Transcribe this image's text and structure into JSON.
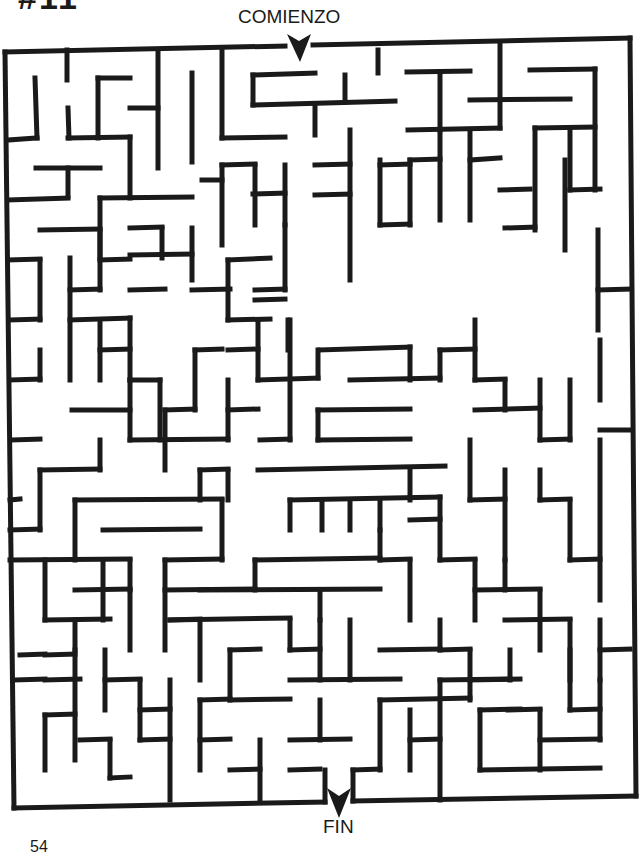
{
  "page": {
    "puzzle_number": "#11",
    "start_label": "COMIENZO",
    "end_label": "FIN",
    "page_number": "54"
  },
  "maze": {
    "wall_color": "#1a1a1a",
    "wall_width": 5,
    "border": [
      [
        5,
        50
      ],
      [
        300,
        44
      ],
      [
        300,
        44
      ],
      [
        300,
        44
      ]
    ],
    "outline": [
      [
        5,
        52,
        285,
        46
      ],
      [
        313,
        45,
        630,
        38
      ],
      [
        630,
        38,
        636,
        796
      ],
      [
        5,
        52,
        14,
        808
      ],
      [
        14,
        808,
        325,
        802
      ],
      [
        353,
        801,
        636,
        796
      ]
    ],
    "walls": [
      [
        35,
        78,
        37,
        138
      ],
      [
        8,
        140,
        37,
        138
      ],
      [
        67,
        50,
        67,
        80
      ],
      [
        68,
        108,
        69,
        138
      ],
      [
        68,
        138,
        130,
        137
      ],
      [
        98,
        78,
        130,
        78
      ],
      [
        98,
        78,
        98,
        138
      ],
      [
        130,
        108,
        158,
        108
      ],
      [
        158,
        50,
        158,
        168
      ],
      [
        192,
        73,
        192,
        162
      ],
      [
        130,
        137,
        130,
        198
      ],
      [
        36,
        168,
        100,
        168
      ],
      [
        68,
        168,
        68,
        196
      ],
      [
        8,
        200,
        68,
        198
      ],
      [
        100,
        198,
        192,
        197
      ],
      [
        100,
        198,
        100,
        258
      ],
      [
        222,
        50,
        222,
        138
      ],
      [
        222,
        138,
        285,
        137
      ],
      [
        253,
        75,
        315,
        73
      ],
      [
        253,
        75,
        253,
        105
      ],
      [
        253,
        105,
        395,
        101
      ],
      [
        315,
        105,
        315,
        135
      ],
      [
        345,
        75,
        345,
        102
      ],
      [
        378,
        50,
        378,
        73
      ],
      [
        407,
        72,
        470,
        71
      ],
      [
        440,
        72,
        440,
        130
      ],
      [
        408,
        130,
        500,
        128
      ],
      [
        470,
        100,
        570,
        99
      ],
      [
        500,
        44,
        500,
        128
      ],
      [
        530,
        70,
        595,
        69
      ],
      [
        595,
        69,
        595,
        190
      ],
      [
        535,
        128,
        595,
        127
      ],
      [
        535,
        128,
        535,
        230
      ],
      [
        202,
        180,
        222,
        180
      ],
      [
        222,
        165,
        222,
        245
      ],
      [
        222,
        165,
        255,
        164
      ],
      [
        255,
        165,
        255,
        225
      ],
      [
        285,
        165,
        285,
        225
      ],
      [
        253,
        194,
        285,
        193
      ],
      [
        315,
        165,
        350,
        164
      ],
      [
        350,
        130,
        350,
        280
      ],
      [
        315,
        195,
        350,
        194
      ],
      [
        380,
        165,
        410,
        164
      ],
      [
        380,
        160,
        380,
        225
      ],
      [
        380,
        225,
        410,
        224
      ],
      [
        410,
        160,
        410,
        225
      ],
      [
        410,
        160,
        440,
        159
      ],
      [
        440,
        130,
        440,
        220
      ],
      [
        470,
        130,
        470,
        220
      ],
      [
        470,
        160,
        500,
        158
      ],
      [
        500,
        190,
        530,
        189
      ],
      [
        570,
        130,
        570,
        190
      ],
      [
        570,
        190,
        600,
        189
      ],
      [
        505,
        228,
        535,
        227
      ],
      [
        565,
        160,
        565,
        250
      ],
      [
        598,
        230,
        598,
        330
      ],
      [
        598,
        290,
        630,
        289
      ],
      [
        40,
        230,
        100,
        229
      ],
      [
        100,
        230,
        100,
        290
      ],
      [
        100,
        260,
        130,
        259
      ],
      [
        130,
        228,
        162,
        227
      ],
      [
        162,
        228,
        162,
        258
      ],
      [
        192,
        228,
        192,
        280
      ],
      [
        130,
        255,
        192,
        254
      ],
      [
        8,
        260,
        40,
        259
      ],
      [
        40,
        260,
        40,
        320
      ],
      [
        70,
        258,
        70,
        380
      ],
      [
        70,
        290,
        100,
        289
      ],
      [
        130,
        290,
        165,
        289
      ],
      [
        10,
        320,
        40,
        319
      ],
      [
        40,
        350,
        40,
        380
      ],
      [
        10,
        380,
        40,
        379
      ],
      [
        70,
        320,
        130,
        318
      ],
      [
        100,
        320,
        100,
        380
      ],
      [
        100,
        350,
        130,
        349
      ],
      [
        130,
        318,
        130,
        380
      ],
      [
        130,
        380,
        160,
        380
      ],
      [
        72,
        410,
        130,
        410
      ],
      [
        130,
        380,
        130,
        440
      ],
      [
        160,
        380,
        160,
        440
      ],
      [
        192,
        290,
        230,
        289
      ],
      [
        228,
        260,
        228,
        320
      ],
      [
        228,
        260,
        270,
        258
      ],
      [
        228,
        320,
        270,
        319
      ],
      [
        255,
        300,
        285,
        299
      ],
      [
        285,
        225,
        285,
        290
      ],
      [
        255,
        290,
        285,
        289
      ],
      [
        258,
        320,
        258,
        380
      ],
      [
        258,
        380,
        318,
        378
      ],
      [
        318,
        378,
        318,
        350
      ],
      [
        288,
        320,
        288,
        350
      ],
      [
        228,
        350,
        258,
        349
      ],
      [
        195,
        350,
        222,
        349
      ],
      [
        195,
        350,
        195,
        410
      ],
      [
        165,
        410,
        195,
        409
      ],
      [
        165,
        410,
        165,
        470
      ],
      [
        228,
        410,
        258,
        409
      ],
      [
        228,
        380,
        228,
        440
      ],
      [
        130,
        440,
        228,
        439
      ],
      [
        100,
        440,
        100,
        470
      ],
      [
        40,
        470,
        100,
        469
      ],
      [
        40,
        470,
        40,
        530
      ],
      [
        12,
        440,
        40,
        439
      ],
      [
        10,
        530,
        40,
        529
      ],
      [
        10,
        500,
        20,
        499
      ],
      [
        228,
        470,
        228,
        500
      ],
      [
        200,
        470,
        228,
        469
      ],
      [
        290,
        320,
        290,
        440
      ],
      [
        260,
        440,
        290,
        439
      ],
      [
        320,
        350,
        410,
        347
      ],
      [
        410,
        347,
        410,
        380
      ],
      [
        350,
        380,
        440,
        378
      ],
      [
        440,
        350,
        440,
        380
      ],
      [
        440,
        350,
        475,
        349
      ],
      [
        475,
        320,
        475,
        380
      ],
      [
        475,
        380,
        505,
        379
      ],
      [
        505,
        380,
        505,
        410
      ],
      [
        475,
        410,
        540,
        408
      ],
      [
        540,
        380,
        540,
        440
      ],
      [
        540,
        440,
        570,
        439
      ],
      [
        570,
        380,
        570,
        440
      ],
      [
        600,
        340,
        600,
        400
      ],
      [
        600,
        430,
        630,
        430
      ],
      [
        318,
        410,
        410,
        409
      ],
      [
        318,
        410,
        318,
        440
      ],
      [
        318,
        440,
        410,
        439
      ],
      [
        258,
        470,
        445,
        466
      ],
      [
        410,
        468,
        410,
        500
      ],
      [
        290,
        500,
        440,
        497
      ],
      [
        290,
        500,
        290,
        530
      ],
      [
        322,
        500,
        322,
        530
      ],
      [
        350,
        500,
        350,
        530
      ],
      [
        380,
        500,
        380,
        530
      ],
      [
        410,
        520,
        440,
        519
      ],
      [
        440,
        497,
        440,
        560
      ],
      [
        470,
        440,
        470,
        500
      ],
      [
        470,
        500,
        505,
        499
      ],
      [
        505,
        470,
        505,
        560
      ],
      [
        540,
        470,
        540,
        500
      ],
      [
        540,
        500,
        570,
        499
      ],
      [
        570,
        500,
        570,
        560
      ],
      [
        600,
        440,
        600,
        600
      ],
      [
        75,
        500,
        222,
        499
      ],
      [
        75,
        500,
        75,
        560
      ],
      [
        103,
        530,
        200,
        529
      ],
      [
        200,
        470,
        200,
        500
      ],
      [
        222,
        500,
        222,
        560
      ],
      [
        165,
        560,
        222,
        559
      ],
      [
        130,
        560,
        130,
        590
      ],
      [
        10,
        560,
        130,
        559
      ],
      [
        45,
        560,
        45,
        620
      ],
      [
        75,
        590,
        130,
        589
      ],
      [
        103,
        560,
        103,
        620
      ],
      [
        130,
        590,
        130,
        650
      ],
      [
        165,
        560,
        165,
        650
      ],
      [
        165,
        590,
        255,
        589
      ],
      [
        255,
        560,
        255,
        590
      ],
      [
        255,
        560,
        380,
        558
      ],
      [
        200,
        590,
        380,
        589
      ],
      [
        320,
        590,
        320,
        620
      ],
      [
        380,
        530,
        380,
        560
      ],
      [
        380,
        560,
        410,
        559
      ],
      [
        410,
        560,
        410,
        620
      ],
      [
        440,
        560,
        475,
        559
      ],
      [
        475,
        560,
        475,
        620
      ],
      [
        475,
        590,
        540,
        589
      ],
      [
        505,
        560,
        505,
        590
      ],
      [
        540,
        590,
        540,
        650
      ],
      [
        570,
        560,
        600,
        559
      ],
      [
        505,
        620,
        570,
        619
      ],
      [
        570,
        620,
        570,
        680
      ],
      [
        600,
        620,
        600,
        680
      ],
      [
        600,
        650,
        630,
        649
      ],
      [
        45,
        620,
        110,
        619
      ],
      [
        75,
        620,
        75,
        650
      ],
      [
        45,
        655,
        75,
        654
      ],
      [
        20,
        655,
        45,
        654
      ],
      [
        45,
        680,
        80,
        679
      ],
      [
        15,
        680,
        45,
        679
      ],
      [
        75,
        650,
        75,
        760
      ],
      [
        45,
        715,
        75,
        714
      ],
      [
        45,
        715,
        45,
        770
      ],
      [
        80,
        740,
        110,
        739
      ],
      [
        110,
        740,
        110,
        778
      ],
      [
        110,
        778,
        130,
        777
      ],
      [
        140,
        680,
        140,
        740
      ],
      [
        105,
        680,
        140,
        679
      ],
      [
        105,
        650,
        105,
        710
      ],
      [
        140,
        740,
        170,
        739
      ],
      [
        170,
        680,
        170,
        800
      ],
      [
        140,
        710,
        170,
        709
      ],
      [
        170,
        620,
        200,
        619
      ],
      [
        200,
        620,
        200,
        680
      ],
      [
        170,
        620,
        290,
        618
      ],
      [
        290,
        620,
        290,
        650
      ],
      [
        230,
        650,
        260,
        649
      ],
      [
        230,
        650,
        230,
        700
      ],
      [
        200,
        700,
        230,
        699
      ],
      [
        200,
        700,
        200,
        770
      ],
      [
        200,
        740,
        230,
        739
      ],
      [
        230,
        770,
        260,
        769
      ],
      [
        260,
        740,
        260,
        800
      ],
      [
        230,
        700,
        290,
        699
      ],
      [
        290,
        650,
        320,
        649
      ],
      [
        320,
        620,
        320,
        680
      ],
      [
        290,
        680,
        400,
        679
      ],
      [
        350,
        620,
        350,
        680
      ],
      [
        380,
        650,
        440,
        649
      ],
      [
        440,
        620,
        440,
        650
      ],
      [
        440,
        650,
        470,
        649
      ],
      [
        470,
        650,
        470,
        700
      ],
      [
        470,
        680,
        520,
        679
      ],
      [
        380,
        700,
        470,
        698
      ],
      [
        380,
        700,
        380,
        770
      ],
      [
        320,
        700,
        320,
        740
      ],
      [
        290,
        740,
        350,
        739
      ],
      [
        290,
        770,
        320,
        769
      ],
      [
        325,
        770,
        325,
        802
      ],
      [
        353,
        770,
        353,
        801
      ],
      [
        353,
        770,
        380,
        769
      ],
      [
        410,
        710,
        410,
        770
      ],
      [
        410,
        740,
        440,
        739
      ],
      [
        440,
        680,
        440,
        800
      ],
      [
        440,
        680,
        510,
        679
      ],
      [
        510,
        650,
        510,
        680
      ],
      [
        480,
        710,
        480,
        770
      ],
      [
        480,
        710,
        520,
        709
      ],
      [
        480,
        770,
        600,
        768
      ],
      [
        540,
        710,
        540,
        770
      ],
      [
        540,
        740,
        600,
        739
      ],
      [
        570,
        650,
        570,
        710
      ],
      [
        570,
        710,
        600,
        709
      ],
      [
        600,
        680,
        600,
        740
      ],
      [
        508,
        710,
        540,
        709
      ]
    ]
  }
}
